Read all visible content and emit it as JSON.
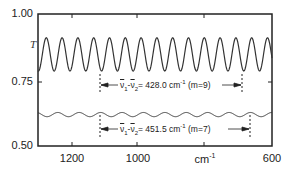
{
  "chart_data": {
    "type": "line",
    "title": "",
    "xlabel": "cm-1",
    "ylabel": "T",
    "xlim": [
      1305,
      600
    ],
    "ylim": [
      0.5,
      1.0
    ],
    "x_reversed": true,
    "grid": false,
    "x_ticks": [
      1200,
      1000,
      800,
      600
    ],
    "x_tick_labels": [
      "1200",
      "1000",
      "cm-1",
      "600"
    ],
    "y_ticks": [
      1.0,
      0.75,
      0.5
    ],
    "y_tick_labels": [
      "1.00",
      "0.75",
      "0.50"
    ],
    "series": [
      {
        "name": "upper interference fringes",
        "description": "large amplitude sinusoidal fringes",
        "center": 0.847,
        "amplitude": 0.063,
        "period_cm": 47.6,
        "x_range": [
          1305,
          600
        ]
      },
      {
        "name": "lower interference fringes",
        "description": "small amplitude sinusoidal fringes",
        "center": 0.619,
        "amplitude": 0.008,
        "period_cm": 64.5,
        "x_range": [
          1305,
          600
        ]
      }
    ],
    "annotations": [
      {
        "text": "ν̄1-ν̄2= 428.0 cm-1 (m=9)",
        "x_start": 1115,
        "x_end": 687,
        "y": 0.744,
        "m": 9,
        "delta": 428.0
      },
      {
        "text": "ν̄1-ν̄2= 451.5 cm-1 (m=7)",
        "x_start": 1115,
        "x_end": 663.5,
        "y": 0.577,
        "m": 7,
        "delta": 451.5
      }
    ]
  },
  "axis": {
    "y_label": "T",
    "y_ticks": [
      "1.00",
      "0.75",
      "0.50"
    ],
    "x_ticks": [
      "1200",
      "1000",
      "cm",
      "600"
    ],
    "x_unit_sup": "-1"
  },
  "annotations": [
    {
      "lhs_a": "ν",
      "sub_a": "1",
      "sep": "-",
      "lhs_b": "ν",
      "sub_b": "2",
      "eq": "= 428.0 cm",
      "sup": "-1",
      "tail": " (m=9)"
    },
    {
      "lhs_a": "ν",
      "sub_a": "1",
      "sep": "-",
      "lhs_b": "ν",
      "sub_b": "2",
      "eq": "= 451.5 cm",
      "sup": "-1",
      "tail": " (m=7)"
    }
  ],
  "colors": {
    "line": "#333333",
    "axis": "#222222",
    "background": "#ffffff"
  }
}
